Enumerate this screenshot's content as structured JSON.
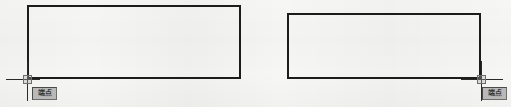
{
  "scene": {
    "background_color": "#f6f6f5",
    "line_color": "#1c1c1c",
    "width": 511,
    "height": 107
  },
  "shapes": [
    {
      "name": "rectangle-left",
      "label": "Rectangle",
      "x": 27,
      "y": 5,
      "width": 214,
      "height": 74
    },
    {
      "name": "rectangle-right",
      "label": "Rectangle",
      "x": 287,
      "y": 13,
      "width": 194,
      "height": 66
    }
  ],
  "cursors": [
    {
      "name": "crosshair-left",
      "x": 27,
      "y": 79,
      "h_start": 6,
      "h_end": 40,
      "v_start": 61,
      "v_end": 101
    },
    {
      "name": "crosshair-right",
      "x": 481,
      "y": 79,
      "h_start": 461,
      "h_end": 503,
      "v_start": 61,
      "v_end": 101
    }
  ],
  "tooltips": [
    {
      "name": "osnap-tooltip-left",
      "text": "端点",
      "x": 32,
      "y": 87,
      "background_color": "#b9b9b9",
      "border_color": "#4a4a4a"
    },
    {
      "name": "osnap-tooltip-right",
      "text": "端点",
      "x": 482,
      "y": 87,
      "background_color": "#b9b9b9",
      "border_color": "#4a4a4a"
    }
  ]
}
